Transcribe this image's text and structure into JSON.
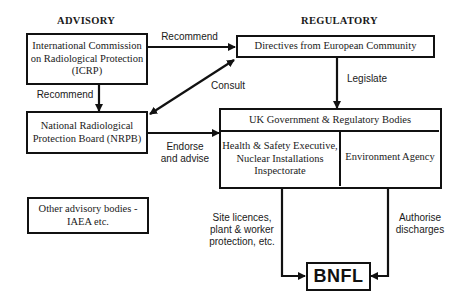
{
  "headings": {
    "advisory": "ADVISORY",
    "regulatory": "REGULATORY"
  },
  "nodes": {
    "icrp": "International Commission\non Radiological Protection\n(ICRP)",
    "nrpb": "National Radiological\nProtection Board (NRPB)",
    "other": "Other advisory bodies -\nIAEA etc.",
    "directives": "Directives from European Community",
    "uk_gov": "UK Government & Regulatory Bodies",
    "hse": "Health & Safety Executive,\nNuclear Installations\nInspectorate",
    "env_agency": "Environment Agency",
    "bnfl": "BNFL"
  },
  "edges": {
    "icrp_to_directives": "Recommend",
    "icrp_to_nrpb": "Recommend",
    "consult": "Consult",
    "legislate": "Legislate",
    "endorse": "Endorse\nand advise",
    "site_licences": "Site licences,\nplant & worker\nprotection, etc.",
    "authorise": "Authorise\ndischarges"
  },
  "colors": {
    "line": "#111111",
    "background": "#ffffff"
  }
}
